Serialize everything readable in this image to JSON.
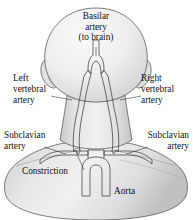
{
  "figure": {
    "name": "posterior-view-head-neck-arteries",
    "background_color": "#ffffff",
    "skin_fill_light": "#f2f2f2",
    "skin_fill_mid": "#dcdcdc",
    "skin_fill_shadow": "#c4c4c4",
    "outline_color": "#4a4a4a",
    "vessel_fill": "#fbfbfb",
    "vessel_outline": "#3d3d3d",
    "label_color": "#111111",
    "leader_color": "#2a2a2a"
  },
  "labels": {
    "basilar": {
      "name": "basilar-artery-label",
      "lines": [
        "Basilar",
        "artery",
        "(to brain)"
      ],
      "line1": "Basilar",
      "line2": "artery",
      "line3": "(to brain)"
    },
    "left_vertebral": {
      "name": "left-vertebral-artery-label",
      "lines": [
        "Left",
        "vertebral",
        "artery"
      ],
      "line1": "Left",
      "line2": "vertebral",
      "line3": "artery"
    },
    "right_vertebral": {
      "name": "right-vertebral-artery-label",
      "lines": [
        "Right",
        "vertebral",
        "artery"
      ],
      "line1": "Right",
      "line2": "vertebral",
      "line3": "artery"
    },
    "left_subclavian": {
      "name": "left-subclavian-artery-label",
      "lines": [
        "Subclavian",
        "artery"
      ],
      "line1": "Subclavian",
      "line2": "artery"
    },
    "right_subclavian": {
      "name": "right-subclavian-artery-label",
      "lines": [
        "Subclavian",
        "artery"
      ],
      "line1": "Subclavian",
      "line2": "artery"
    },
    "constriction": {
      "name": "constriction-label",
      "line1": "Constriction"
    },
    "aorta": {
      "name": "aorta-label",
      "line1": "Aorta"
    }
  }
}
